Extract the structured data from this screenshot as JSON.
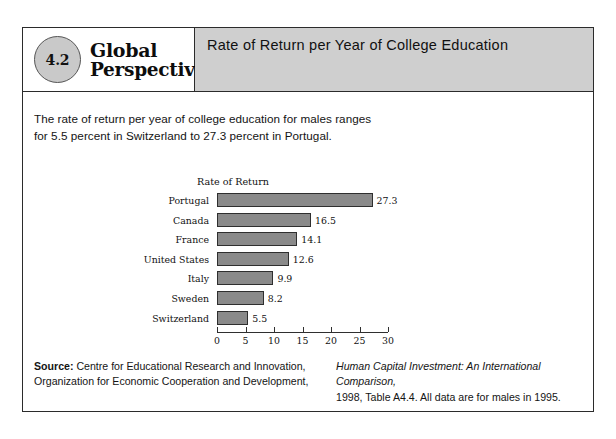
{
  "figure": {
    "badge_number": "4.2",
    "brand_line_1": "Global",
    "brand_line_2": "Perspective",
    "header_title": "Rate of Return per Year of College Education",
    "intro_text": "The rate of return per year of college education for males ranges for 5.5 percent in Switzerland to 27.3 percent in Portugal."
  },
  "chart_data": {
    "type": "bar",
    "orientation": "horizontal",
    "title": "Rate of Return",
    "xlabel": "",
    "ylabel": "",
    "categories": [
      "Portugal",
      "Canada",
      "France",
      "United States",
      "Italy",
      "Sweden",
      "Switzerland"
    ],
    "values": [
      27.3,
      16.5,
      14.1,
      12.6,
      9.9,
      8.2,
      5.5
    ],
    "value_labels": [
      "27.3",
      "16.5",
      "14.1",
      "12.6",
      "9.9",
      "8.2",
      "5.5"
    ],
    "xlim": [
      0,
      30
    ],
    "xticks": [
      0,
      5,
      10,
      15,
      20,
      25,
      30
    ],
    "xtick_labels": [
      "0",
      "5",
      "10",
      "15",
      "20",
      "25",
      "30"
    ],
    "grid": false,
    "legend": false,
    "bar_color": "#8a8a8a",
    "bar_border_color": "#2f2f2f"
  },
  "source": {
    "label": "Source:",
    "left_line_1": " Centre for Educational Research and Innovation,",
    "left_line_2": "Organization for Economic Cooperation and Development,",
    "right_line_1": "Human Capital Investment: An International Comparison,",
    "right_line_2": "1998, Table A4.4. All data are for males in 1995."
  },
  "colors": {
    "header_band": "#cfcfcf",
    "badge_fill": "#c9c9c9",
    "frame_border": "#2b2b2b"
  }
}
